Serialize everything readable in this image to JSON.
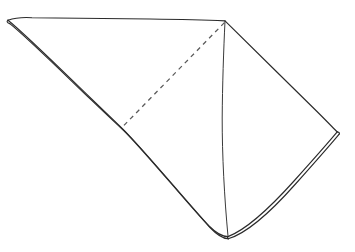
{
  "figure": {
    "canvas": {
      "width": 355,
      "height": 252
    },
    "colors": {
      "background": "#ffffff",
      "outline": "#2b2b2b",
      "outline_secondary": "#3a3a3a",
      "dashed_fold": "#5a5a5a",
      "face_fill": "#ffffff"
    },
    "vertices": {
      "left_tip": {
        "x": 8,
        "y": 20
      },
      "top_right": {
        "x": 225,
        "y": 21
      },
      "right_corner": {
        "x": 337,
        "y": 132
      },
      "bottom_corner": {
        "x": 228,
        "y": 236
      },
      "left_edge_bend": {
        "x": 122,
        "y": 128
      },
      "dashed_fold_end": {
        "x": 123,
        "y": 126
      }
    },
    "paths": {
      "face_upper_left": "M 8,20 L 30,17.6 L 80,18.2 L 130,18.8 L 180,19.6 L 225,20.8 L 222.5,120 L 123,126 Z",
      "face_lower_left": "M 123,126 L 222.5,120 L 228,236 L 122,128 Z",
      "face_right": "M 225,20.8 L 337,132 L 228,236 L 222.5,120 Z",
      "top_edge": "M 8,20.2 C 16,17.4 24,17.2 32,17.7 C 70,18.1 110,18.4 150,19.0 C 180,19.4 205,20.0 225,20.9",
      "left_edge_outer": "M 8,20.2 C 24,33 58,66.5 90,97.5 C 104,111 115,121.5 122.2,128.3 C 145,151 185,200 209,226 C 216,233 222,236.6 228,236.6",
      "left_edge_inner": "M 9.8,23.6 C 25.5,36 59,69 91.5,100.2 C 105.5,113.6 116.8,124.2 124.2,131.0 C 147,153.8 186,202 210,227.5 C 216.5,234.3 222.5,238.6 228.2,238.8",
      "left_tip_cap": "M 8,20.2 C 6.6,21.2 6.6,22.6 9.8,23.6",
      "upper_right_edge": "M 225,20.9 C 250,45.5 290,85.0 318,112.5 C 327,121.5 333.5,128.2 337.2,131.9",
      "lower_right_edge_outer": "M 337.2,131.9 C 330,140.5 312,161.0 294,181.0 C 272,205.5 248,229.0 228,236.6",
      "lower_right_edge_inner": "M 339.0,134.3 C 331.8,143.0 313.5,163.8 295.5,184.0 C 273.5,208.8 249,232.6 228.2,238.8",
      "right_corner_cap": "M 337.2,131.9 C 339.4,132.2 340.0,133.2 339.0,134.3",
      "bottom_corner_cap": "M 228,236.6 C 227.2,237.9 227.4,238.8 228.2,238.8",
      "center_vertical": "M 225,21.3 C 223.6,50 222.4,86 222.2,118 C 222.1,155 224.4,198 228,236.2",
      "dashed_fold": "M 224.4,22.6 L 123.2,126.2"
    },
    "elements": [
      {
        "name": "top-edge",
        "kind": "fold-edge",
        "style": "solid"
      },
      {
        "name": "left-edge",
        "kind": "paper-edge",
        "style": "double-solid"
      },
      {
        "name": "upper-right-edge",
        "kind": "fold-edge",
        "style": "solid"
      },
      {
        "name": "lower-right-edge",
        "kind": "paper-edge",
        "style": "double-solid"
      },
      {
        "name": "center-vertical-fold",
        "kind": "fold-edge",
        "style": "solid"
      },
      {
        "name": "diagonal-fold",
        "kind": "hidden-fold",
        "style": "dashed"
      }
    ]
  }
}
